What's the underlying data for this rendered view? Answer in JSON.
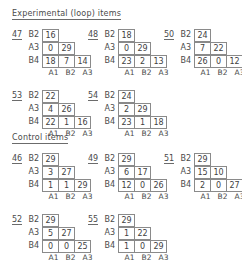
{
  "page": {
    "background": "#ffffff",
    "ink": "#3f3f3f",
    "rule_color": "#6b6b6b"
  },
  "sections": [
    {
      "id": "experimental",
      "title": "Experimental (loop) items"
    },
    {
      "id": "control",
      "title": "Control items"
    }
  ],
  "column_labels": [
    "A1",
    "B2",
    "A3"
  ],
  "row_labels": [
    "B2",
    "A3",
    "B4"
  ],
  "matrices": [
    {
      "id": "47",
      "section": "experimental",
      "rows": [
        {
          "label": "B2",
          "values": [
            "16"
          ]
        },
        {
          "label": "A3",
          "values": [
            "0",
            "29"
          ]
        },
        {
          "label": "B4",
          "values": [
            "18",
            "7",
            "14"
          ]
        }
      ],
      "columns": [
        "A1",
        "B2",
        "A3"
      ]
    },
    {
      "id": "48",
      "section": "experimental",
      "rows": [
        {
          "label": "B2",
          "values": [
            "18"
          ]
        },
        {
          "label": "A3",
          "values": [
            "0",
            "29"
          ]
        },
        {
          "label": "B4",
          "values": [
            "23",
            "2",
            "13"
          ]
        }
      ],
      "columns": [
        "A1",
        "B2",
        "A3"
      ]
    },
    {
      "id": "50",
      "section": "experimental",
      "rows": [
        {
          "label": "B2",
          "values": [
            "24"
          ]
        },
        {
          "label": "A3",
          "values": [
            "7",
            "22"
          ]
        },
        {
          "label": "B4",
          "values": [
            "26",
            "0",
            "12"
          ]
        }
      ],
      "columns": [
        "A1",
        "B2",
        "A3"
      ]
    },
    {
      "id": "53",
      "section": "experimental",
      "rows": [
        {
          "label": "B2",
          "values": [
            "22"
          ]
        },
        {
          "label": "A3",
          "values": [
            "4",
            "26"
          ]
        },
        {
          "label": "B4",
          "values": [
            "22",
            "1",
            "16"
          ]
        }
      ],
      "columns": [
        "A1",
        "B2",
        "A3"
      ]
    },
    {
      "id": "54",
      "section": "experimental",
      "rows": [
        {
          "label": "B2",
          "values": [
            "24"
          ]
        },
        {
          "label": "A3",
          "values": [
            "2",
            "29"
          ]
        },
        {
          "label": "B4",
          "values": [
            "23",
            "1",
            "18"
          ]
        }
      ],
      "columns": [
        "A1",
        "B2",
        "A3"
      ]
    },
    {
      "id": "46",
      "section": "control",
      "rows": [
        {
          "label": "B2",
          "values": [
            "29"
          ]
        },
        {
          "label": "A3",
          "values": [
            "3",
            "27"
          ]
        },
        {
          "label": "B4",
          "values": [
            "1",
            "1",
            "29"
          ]
        }
      ],
      "columns": [
        "A1",
        "B2",
        "A3"
      ]
    },
    {
      "id": "49",
      "section": "control",
      "rows": [
        {
          "label": "B2",
          "values": [
            "29"
          ]
        },
        {
          "label": "A3",
          "values": [
            "6",
            "17"
          ]
        },
        {
          "label": "B4",
          "values": [
            "12",
            "0",
            "26"
          ]
        }
      ],
      "columns": [
        "A1",
        "B2",
        "A3"
      ]
    },
    {
      "id": "51",
      "section": "control",
      "rows": [
        {
          "label": "B2",
          "values": [
            "29"
          ]
        },
        {
          "label": "A3",
          "values": [
            "15",
            "10"
          ]
        },
        {
          "label": "B4",
          "values": [
            "2",
            "0",
            "27"
          ]
        }
      ],
      "columns": [
        "A1",
        "B2",
        "A3"
      ]
    },
    {
      "id": "52",
      "section": "control",
      "rows": [
        {
          "label": "B2",
          "values": [
            "29"
          ]
        },
        {
          "label": "A3",
          "values": [
            "5",
            "27"
          ]
        },
        {
          "label": "B4",
          "values": [
            "0",
            "0",
            "25"
          ]
        }
      ],
      "columns": [
        "A1",
        "B2",
        "A3"
      ]
    },
    {
      "id": "55",
      "section": "control",
      "rows": [
        {
          "label": "B2",
          "values": [
            "29"
          ]
        },
        {
          "label": "A3",
          "values": [
            "1",
            "22"
          ]
        },
        {
          "label": "B4",
          "values": [
            "1",
            "0",
            "29"
          ]
        }
      ],
      "columns": [
        "A1",
        "B2",
        "A3"
      ]
    }
  ],
  "layout": {
    "section_positions": [
      {
        "id": "experimental",
        "x": 12,
        "y": 9
      },
      {
        "id": "control",
        "x": 12,
        "y": 133
      }
    ],
    "matrix_positions": [
      {
        "id": "47",
        "x": 12,
        "y": 21
      },
      {
        "id": "48",
        "x": 88,
        "y": 21
      },
      {
        "id": "50",
        "x": 164,
        "y": 21
      },
      {
        "id": "53",
        "x": 12,
        "y": 82
      },
      {
        "id": "54",
        "x": 88,
        "y": 82
      },
      {
        "id": "46",
        "x": 12,
        "y": 145
      },
      {
        "id": "49",
        "x": 88,
        "y": 145
      },
      {
        "id": "51",
        "x": 164,
        "y": 145
      },
      {
        "id": "52",
        "x": 12,
        "y": 206
      },
      {
        "id": "55",
        "x": 88,
        "y": 206
      }
    ]
  }
}
